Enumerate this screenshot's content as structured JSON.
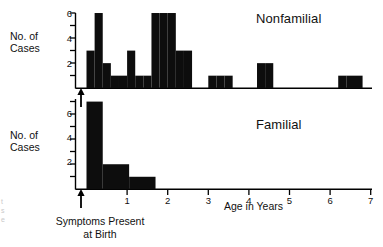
{
  "figure": {
    "background": "#ffffff",
    "ink_color": "#000000",
    "bar_color": "#0d0d0d"
  },
  "panels": {
    "top": {
      "title": "Nonfamilial",
      "y_axis_label": "No. of\nCases",
      "y_ticks_labeled": [
        "2",
        "4",
        "6"
      ],
      "y_ticks_all": [
        1,
        2,
        3,
        4,
        5,
        6
      ]
    },
    "bottom": {
      "title": "Familial",
      "y_axis_label": "No. of\nCases",
      "y_ticks_labeled": [
        "2",
        "4",
        "6"
      ],
      "y_ticks_all": [
        1,
        2,
        3,
        4,
        5,
        6,
        7
      ]
    }
  },
  "x_axis": {
    "title": "Age in Years",
    "tick_labels": [
      "1",
      "2",
      "3",
      "4",
      "5",
      "6",
      "7"
    ],
    "tick_values": [
      1,
      2,
      3,
      4,
      5,
      6,
      7
    ],
    "range": [
      0,
      7
    ]
  },
  "annotation": {
    "arrow_caption": "Symptoms Present\nat Birth",
    "arrow_x_value": -0.18
  },
  "edge_artifacts": {
    "text": "t\ns\ne"
  },
  "chart_data": {
    "type": "bar",
    "xlabel": "Age in Years",
    "ylabel": "No. of Cases",
    "xlim": [
      0,
      7
    ],
    "grid": false,
    "legend": "none",
    "bin_width": 0.2,
    "panels": [
      {
        "name": "Nonfamilial",
        "ylim": [
          0,
          6
        ],
        "ytick_labels": [
          "2",
          "4",
          "6"
        ],
        "ytick_values": [
          2,
          4,
          6
        ],
        "bins": [
          {
            "x0": 0.0,
            "x1": 0.2,
            "value": 3
          },
          {
            "x0": 0.2,
            "x1": 0.4,
            "value": 6
          },
          {
            "x0": 0.4,
            "x1": 0.6,
            "value": 2
          },
          {
            "x0": 0.6,
            "x1": 0.8,
            "value": 1
          },
          {
            "x0": 0.8,
            "x1": 1.0,
            "value": 1
          },
          {
            "x0": 1.0,
            "x1": 1.2,
            "value": 3
          },
          {
            "x0": 1.2,
            "x1": 1.4,
            "value": 1
          },
          {
            "x0": 1.4,
            "x1": 1.6,
            "value": 1
          },
          {
            "x0": 1.6,
            "x1": 1.8,
            "value": 6
          },
          {
            "x0": 1.8,
            "x1": 2.0,
            "value": 6
          },
          {
            "x0": 2.0,
            "x1": 2.2,
            "value": 6
          },
          {
            "x0": 2.2,
            "x1": 2.4,
            "value": 3
          },
          {
            "x0": 2.4,
            "x1": 2.6,
            "value": 3
          },
          {
            "x0": 2.6,
            "x1": 2.8,
            "value": 0
          },
          {
            "x0": 2.8,
            "x1": 3.0,
            "value": 0
          },
          {
            "x0": 3.0,
            "x1": 3.2,
            "value": 1
          },
          {
            "x0": 3.2,
            "x1": 3.4,
            "value": 1
          },
          {
            "x0": 3.4,
            "x1": 3.6,
            "value": 1
          },
          {
            "x0": 3.6,
            "x1": 3.8,
            "value": 0
          },
          {
            "x0": 3.8,
            "x1": 4.0,
            "value": 0
          },
          {
            "x0": 4.0,
            "x1": 4.2,
            "value": 0
          },
          {
            "x0": 4.2,
            "x1": 4.4,
            "value": 2
          },
          {
            "x0": 4.4,
            "x1": 4.6,
            "value": 2
          },
          {
            "x0": 4.6,
            "x1": 4.8,
            "value": 0
          },
          {
            "x0": 4.8,
            "x1": 6.2,
            "value": 0
          },
          {
            "x0": 6.2,
            "x1": 6.4,
            "value": 1
          },
          {
            "x0": 6.4,
            "x1": 6.8,
            "value": 1
          }
        ]
      },
      {
        "name": "Familial",
        "ylim": [
          0,
          7
        ],
        "ytick_labels": [
          "2",
          "4",
          "6"
        ],
        "ytick_values": [
          2,
          4,
          6
        ],
        "bins": [
          {
            "x0": 0.0,
            "x1": 0.4,
            "value": 7
          },
          {
            "x0": 0.4,
            "x1": 1.05,
            "value": 2
          },
          {
            "x0": 1.05,
            "x1": 1.7,
            "value": 1
          },
          {
            "x0": 1.7,
            "x1": 7.0,
            "value": 0
          }
        ]
      }
    ]
  }
}
